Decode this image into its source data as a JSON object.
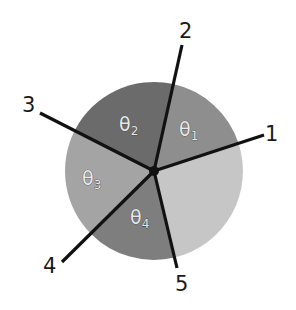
{
  "diagram": {
    "center": {
      "x": 154,
      "y": 171
    },
    "radius": 89,
    "sectors": [
      {
        "id": "theta1",
        "symbol": "θ",
        "subscript": "1",
        "color": "#8e8e8e"
      },
      {
        "id": "theta2",
        "symbol": "θ",
        "subscript": "2",
        "color": "#6b6b6b"
      },
      {
        "id": "theta3",
        "symbol": "θ",
        "subscript": "3",
        "color": "#a4a4a4"
      },
      {
        "id": "theta4",
        "symbol": "θ",
        "subscript": "4",
        "color": "#7e7e7e"
      },
      {
        "id": "unlabeled",
        "symbol": "",
        "subscript": "",
        "color": "#c6c6c6"
      }
    ],
    "rays": [
      {
        "label": "1"
      },
      {
        "label": "2"
      },
      {
        "label": "3"
      },
      {
        "label": "4"
      },
      {
        "label": "5"
      }
    ],
    "line_color": "#111111",
    "center_dot_color": "#111111"
  }
}
